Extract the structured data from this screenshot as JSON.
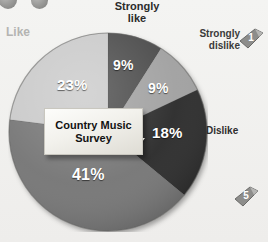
{
  "chart_data": {
    "type": "pie",
    "title": "Country Music Survey",
    "title_lines": [
      "Country Music",
      "Survey"
    ],
    "categories": [
      "Strongly like",
      "Strongly dislike",
      "Dislike",
      "Neither like nor dislike",
      "Like"
    ],
    "values": [
      9,
      9,
      18,
      41,
      23
    ],
    "value_labels": [
      "9%",
      "9%",
      "18%",
      "41%",
      "23%"
    ],
    "slice_colors": [
      "#4a4a4a",
      "#a0a0a0",
      "#2c2c2c",
      "#757575",
      "#c9c9c9"
    ],
    "start_angle_deg": 0,
    "direction": "clockwise",
    "legend": "outside-labels",
    "grid": false,
    "xlabel": "",
    "ylabel": ""
  },
  "labels": {
    "strongly_like": "Strongly\nlike",
    "strongly_dislike": "Strongly\ndislike",
    "dislike": "Dislike",
    "like": "Like"
  },
  "percentages": {
    "strongly_like": "9%",
    "strongly_dislike": "9%",
    "dislike": "18%",
    "neither": "41%",
    "like": "23%"
  },
  "center_callout": {
    "line1": "Country Music",
    "line2": "Survey"
  },
  "badges": {
    "top_right": "1",
    "bottom_right": "5"
  },
  "icons": {
    "corner_dot_a": "circle-dot-icon",
    "corner_dot_b": "circle-dot-icon",
    "ribbon_one": "ribbon-badge-1-icon",
    "ribbon_five": "ribbon-badge-5-icon"
  }
}
